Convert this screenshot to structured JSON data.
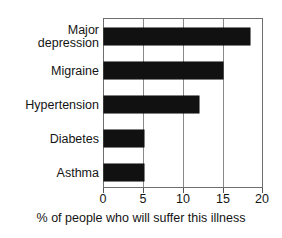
{
  "chart_data": {
    "type": "bar",
    "orientation": "horizontal",
    "title": "",
    "xlabel": "% of people who will suffer this illness",
    "ylabel": "",
    "categories": [
      "Major depression",
      "Migraine",
      "Hypertension",
      "Diabetes",
      "Asthma"
    ],
    "category_lines": [
      [
        "Major",
        "depression"
      ],
      [
        "Migraine"
      ],
      [
        "Hypertension"
      ],
      [
        "Diabetes"
      ],
      [
        "Asthma"
      ]
    ],
    "values": [
      18.4,
      15,
      12,
      5,
      5
    ],
    "xlim": [
      0,
      20
    ],
    "xticks": [
      0,
      5,
      10,
      15,
      20
    ],
    "xtick_labels": [
      "0",
      "5",
      "10",
      "15",
      "20"
    ],
    "grid": "vertical",
    "legend": "none",
    "bar_color": "#111111",
    "frame_color": "#6e6e6e",
    "gridline_color": "#8a8a8a",
    "background": "#ffffff"
  }
}
